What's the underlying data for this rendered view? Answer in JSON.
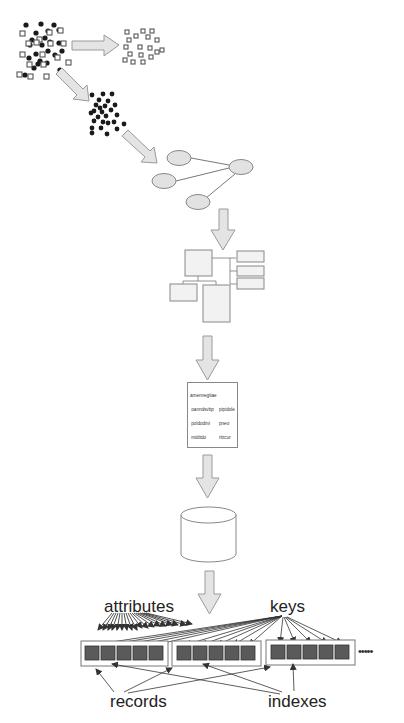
{
  "diagram": {
    "colors": {
      "arrow_fill": "#e4e4e4",
      "arrow_stroke": "#9a9a9a",
      "node_fill": "#e2e2e2",
      "node_stroke": "#888888",
      "dot_fill": "#1a1a1a",
      "square_stroke": "#555555",
      "record_cell_fill": "#5a5a5a",
      "line_color": "#333333"
    },
    "stages": [
      {
        "id": "raw-data",
        "shape": "mixed dots and squares"
      },
      {
        "id": "filtered-squares",
        "shape": "squares cluster"
      },
      {
        "id": "filtered-dots",
        "shape": "dots cluster"
      },
      {
        "id": "network-graph",
        "shape": "4 ellipse nodes, hub connected to 3"
      },
      {
        "id": "schema-tree",
        "shape": "boxes connected in tree"
      },
      {
        "id": "text-document",
        "shape": "document with text"
      },
      {
        "id": "database",
        "shape": "cylinder"
      },
      {
        "id": "record-store",
        "shape": "3 record groups x 5 cells, continuation"
      }
    ],
    "document_text": {
      "left_column": [
        "amennegitae",
        " oanndsvbp",
        " poldodmi",
        " miditdo",
        " mirpidpolfi",
        " milfidl",
        "   rnrhrvhgr",
        "      mdsp",
        "      mvpbitu",
        "      rhhyfli",
        "   muful",
        "   mrhgful"
      ],
      "right_column": [
        "",
        "pipidole",
        "pneo",
        "ritrcur",
        "ritfy",
        "mnnh",
        "",
        "mocdfo",
        "pkil",
        "piitcil",
        "pilfo",
        "ihovudo"
      ]
    },
    "labels": {
      "attributes": "attributes",
      "keys": "keys",
      "records": "records",
      "indexes": "indexes",
      "continuation": "•••••"
    },
    "record_groups": [
      {
        "cells": 5
      },
      {
        "cells": 5
      },
      {
        "cells": 5
      }
    ]
  }
}
